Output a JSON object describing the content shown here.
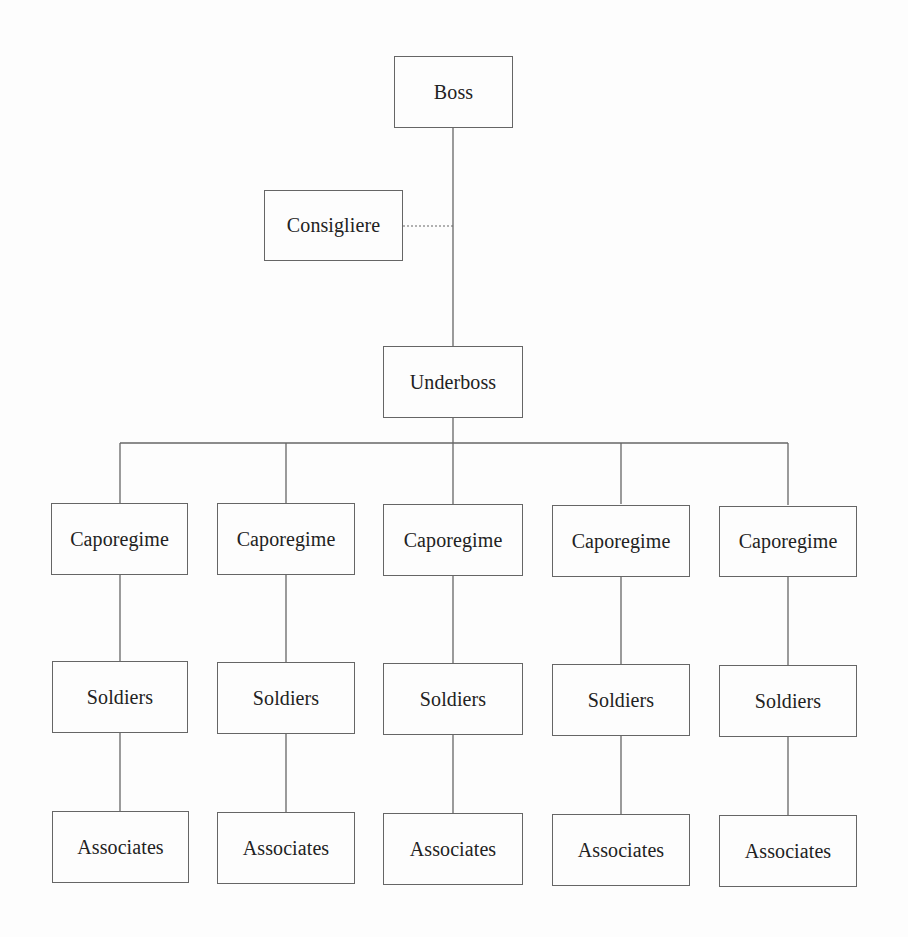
{
  "diagram": {
    "top": {
      "boss": "Boss",
      "consigliere": "Consigliere",
      "underboss": "Underboss"
    },
    "columns": [
      {
        "caporegime": "Caporegime",
        "soldiers": "Soldiers",
        "associates": "Associates"
      },
      {
        "caporegime": "Caporegime",
        "soldiers": "Soldiers",
        "associates": "Associates"
      },
      {
        "caporegime": "Caporegime",
        "soldiers": "Soldiers",
        "associates": "Associates"
      },
      {
        "caporegime": "Caporegime",
        "soldiers": "Soldiers",
        "associates": "Associates"
      },
      {
        "caporegime": "Caporegime",
        "soldiers": "Soldiers",
        "associates": "Associates"
      }
    ],
    "connectors": {
      "boss_to_underboss": "solid",
      "consigliere_to_boss_line": "dotted",
      "underboss_to_caporegimes": "solid",
      "caporegime_to_soldiers": "solid",
      "soldiers_to_associates": "solid"
    },
    "colors": {
      "line": "#666666",
      "text": "#222222",
      "background": "#fdfdfd"
    }
  }
}
